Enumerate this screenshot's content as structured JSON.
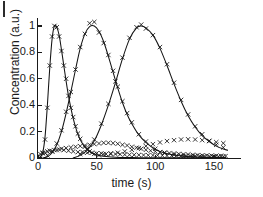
{
  "figure": {
    "panel_label": "",
    "background": "#ffffff",
    "ink_color": "#141414"
  },
  "axes": {
    "xlabel": "time (s)",
    "ylabel": "Concentration (a.u.)",
    "xticks": [
      0,
      50,
      100,
      150
    ],
    "xtick_labels": [
      "0",
      "50",
      "100",
      "150"
    ],
    "yticks": [
      0,
      0.2,
      0.4,
      0.6,
      0.8,
      1
    ],
    "ytick_labels": [
      "0",
      "0.2",
      "0.4",
      "0.6",
      "0.8",
      "1"
    ]
  },
  "chart_data": {
    "type": "scatter",
    "title": "",
    "xlabel": "time (s)",
    "ylabel": "Concentration (a.u.)",
    "xlim": [
      0,
      162
    ],
    "ylim": [
      0,
      1.06
    ],
    "grid": false,
    "legend": false,
    "marker": "x",
    "marker_color": "#141414",
    "line_color": "#141414",
    "note": "Three elution/diffusion peaks; solid lines are model fits, x markers are measured data. Low-amplitude x-marker baselines accompany each peak.",
    "series": [
      {
        "name": "peak-1-fit",
        "kind": "line",
        "peak_time": 14,
        "peak_value": 1.0,
        "x": [
          0,
          2,
          4,
          6,
          8,
          10,
          12,
          14,
          16,
          18,
          20,
          22,
          24,
          26,
          28,
          30,
          32,
          34,
          36,
          38,
          40,
          44,
          48,
          52,
          56,
          60,
          66,
          72,
          80,
          90,
          100,
          120,
          140,
          160
        ],
        "y": [
          0.0,
          0.005,
          0.04,
          0.16,
          0.4,
          0.68,
          0.9,
          1.0,
          0.99,
          0.93,
          0.82,
          0.7,
          0.58,
          0.47,
          0.38,
          0.3,
          0.235,
          0.18,
          0.14,
          0.108,
          0.083,
          0.049,
          0.03,
          0.019,
          0.013,
          0.009,
          0.006,
          0.004,
          0.003,
          0.002,
          0.002,
          0.001,
          0.001,
          0.001
        ]
      },
      {
        "name": "peak-1-data",
        "kind": "scatter",
        "x": [
          2,
          4,
          6,
          8,
          10,
          12,
          14,
          16,
          18,
          20,
          22,
          24,
          26,
          28,
          30,
          32,
          34,
          36,
          40,
          44,
          48,
          52
        ],
        "y": [
          0.01,
          0.04,
          0.14,
          0.38,
          0.7,
          0.92,
          1.0,
          0.99,
          0.92,
          0.81,
          0.7,
          0.6,
          0.47,
          0.38,
          0.31,
          0.24,
          0.185,
          0.145,
          0.085,
          0.05,
          0.031,
          0.02
        ]
      },
      {
        "name": "peak-2-fit",
        "kind": "line",
        "peak_time": 48,
        "peak_value": 1.0,
        "x": [
          4,
          8,
          12,
          16,
          20,
          24,
          28,
          32,
          36,
          40,
          44,
          48,
          52,
          56,
          60,
          64,
          68,
          72,
          76,
          80,
          86,
          92,
          100,
          108,
          116,
          124,
          132,
          140,
          150,
          160
        ],
        "y": [
          0.0,
          0.01,
          0.04,
          0.1,
          0.2,
          0.34,
          0.5,
          0.67,
          0.83,
          0.94,
          0.995,
          1.0,
          0.96,
          0.88,
          0.77,
          0.65,
          0.53,
          0.42,
          0.33,
          0.26,
          0.175,
          0.118,
          0.065,
          0.037,
          0.022,
          0.014,
          0.009,
          0.006,
          0.004,
          0.003
        ]
      },
      {
        "name": "peak-2-data",
        "kind": "scatter",
        "x": [
          8,
          12,
          16,
          20,
          24,
          28,
          32,
          36,
          40,
          44,
          48,
          52,
          56,
          60,
          64,
          68,
          72,
          76,
          80,
          86,
          92,
          100,
          108,
          116,
          124,
          132,
          140,
          150
        ],
        "y": [
          0.02,
          0.05,
          0.11,
          0.21,
          0.35,
          0.5,
          0.67,
          0.84,
          0.94,
          1.02,
          1.03,
          0.95,
          0.87,
          0.78,
          0.66,
          0.54,
          0.43,
          0.34,
          0.27,
          0.18,
          0.125,
          0.07,
          0.04,
          0.025,
          0.015,
          0.01,
          0.007,
          0.005
        ]
      },
      {
        "name": "peak-3-fit",
        "kind": "line",
        "peak_time": 88,
        "peak_value": 1.0,
        "x": [
          30,
          36,
          42,
          48,
          54,
          60,
          66,
          72,
          78,
          84,
          88,
          92,
          98,
          104,
          110,
          116,
          122,
          128,
          134,
          140,
          146,
          152,
          158,
          162
        ],
        "y": [
          0.0,
          0.02,
          0.06,
          0.13,
          0.25,
          0.4,
          0.57,
          0.75,
          0.9,
          0.985,
          1.0,
          0.985,
          0.93,
          0.83,
          0.7,
          0.56,
          0.43,
          0.32,
          0.235,
          0.17,
          0.125,
          0.09,
          0.068,
          0.058
        ]
      },
      {
        "name": "peak-3-data",
        "kind": "scatter",
        "x": [
          36,
          42,
          48,
          54,
          60,
          66,
          72,
          78,
          84,
          88,
          92,
          98,
          104,
          110,
          116,
          122,
          128,
          134,
          140,
          146,
          152,
          158
        ],
        "y": [
          0.03,
          0.07,
          0.14,
          0.26,
          0.41,
          0.58,
          0.76,
          0.91,
          0.99,
          1.01,
          0.98,
          0.93,
          0.84,
          0.71,
          0.57,
          0.44,
          0.33,
          0.24,
          0.18,
          0.13,
          0.1,
          0.08
        ]
      },
      {
        "name": "baseline-a",
        "kind": "scatter",
        "x": [
          2,
          4,
          6,
          8,
          10,
          14,
          18,
          22,
          26,
          30,
          34,
          38,
          42,
          46,
          50,
          54,
          58,
          62,
          66,
          70,
          74,
          78,
          82,
          86,
          90,
          94,
          98,
          102,
          106,
          110,
          114,
          118,
          122,
          126,
          130,
          134,
          138,
          142,
          146,
          150,
          154,
          158
        ],
        "y": [
          0.03,
          0.035,
          0.04,
          0.05,
          0.055,
          0.06,
          0.065,
          0.06,
          0.055,
          0.05,
          0.045,
          0.045,
          0.04,
          0.04,
          0.035,
          0.035,
          0.03,
          0.03,
          0.03,
          0.028,
          0.026,
          0.025,
          0.024,
          0.023,
          0.022,
          0.021,
          0.02,
          0.02,
          0.019,
          0.018,
          0.018,
          0.017,
          0.016,
          0.016,
          0.015,
          0.015,
          0.014,
          0.014,
          0.013,
          0.013,
          0.012,
          0.012
        ]
      },
      {
        "name": "baseline-b",
        "kind": "scatter",
        "x": [
          12,
          16,
          20,
          24,
          28,
          32,
          36,
          40,
          44,
          48,
          52,
          56,
          60,
          64,
          68,
          72,
          76,
          80,
          84,
          88,
          92,
          96,
          100,
          104,
          108,
          112,
          116,
          120,
          124,
          128,
          132,
          136,
          140,
          144,
          148,
          152,
          156,
          160
        ],
        "y": [
          0.05,
          0.06,
          0.07,
          0.075,
          0.08,
          0.085,
          0.09,
          0.095,
          0.1,
          0.105,
          0.11,
          0.115,
          0.115,
          0.112,
          0.108,
          0.1,
          0.095,
          0.085,
          0.078,
          0.07,
          0.062,
          0.055,
          0.05,
          0.045,
          0.04,
          0.037,
          0.034,
          0.031,
          0.028,
          0.026,
          0.024,
          0.022,
          0.02,
          0.019,
          0.018,
          0.017,
          0.016,
          0.015
        ]
      },
      {
        "name": "baseline-c",
        "kind": "scatter",
        "x": [
          56,
          62,
          68,
          74,
          80,
          86,
          92,
          98,
          104,
          110,
          116,
          122,
          128,
          134,
          140,
          146,
          152,
          158
        ],
        "y": [
          0.03,
          0.035,
          0.04,
          0.05,
          0.062,
          0.075,
          0.09,
          0.105,
          0.118,
          0.128,
          0.135,
          0.14,
          0.142,
          0.14,
          0.135,
          0.128,
          0.12,
          0.112
        ]
      }
    ]
  }
}
